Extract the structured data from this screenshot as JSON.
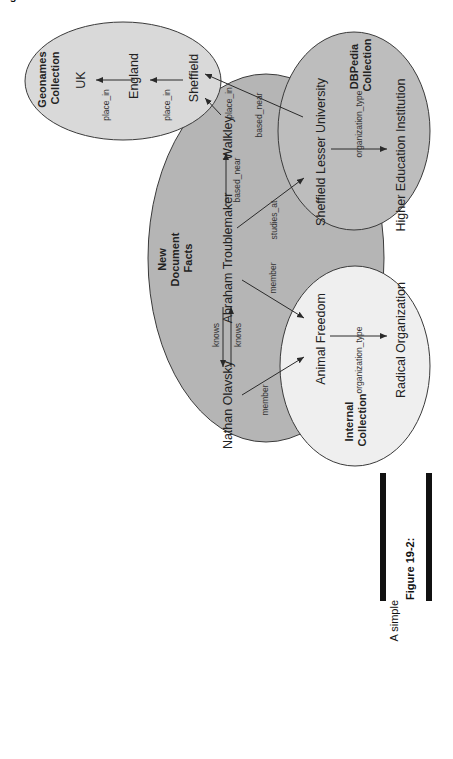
{
  "figure": {
    "orientation": "rotated-90-ccw",
    "caption": {
      "label": "Figure 19-2:",
      "lines": [
        "A simple",
        "graph",
        "showing",
        "assertions",
        "across four",
        "different",
        "ontologies."
      ]
    }
  },
  "colors": {
    "background": "#ffffff",
    "new_document_fill": "#b5b5b5",
    "dbpedia_fill": "#bdbdbd",
    "geonames_fill": "#d9d9d9",
    "internal_fill": "#efefef",
    "stroke": "#3a3a3a",
    "caption_bar": "#111111"
  },
  "collections": {
    "geonames": {
      "title_line1": "Geonames",
      "title_line2": "Collection"
    },
    "new_document": {
      "title_line1": "New",
      "title_line2": "Document",
      "title_line3": "Facts"
    },
    "dbpedia": {
      "title_line1": "DBPedia",
      "title_line2": "Collection"
    },
    "internal": {
      "title_line1": "Internal",
      "title_line2": "Collection"
    }
  },
  "nodes": {
    "uk": "UK",
    "england": "England",
    "sheffield": "Sheffield",
    "walkley": "Walkley",
    "abraham": "Abraham Troublemaker",
    "nathan": "Nathan Olavsky",
    "sheffield_lesser": "Sheffield Lesser University",
    "higher_ed": "Higher Education Institution",
    "animal_freedom": "Animal Freedom",
    "radical_org": "Radical Organization"
  },
  "edges": {
    "england_uk": "place_in",
    "sheffield_england": "place_in",
    "walkley_sheffield": "place_in",
    "abraham_walkley": "based_near",
    "slu_sheffield": "based_near",
    "abraham_slu": "studies_at",
    "abraham_af": "member",
    "nathan_af": "member",
    "nathan_abraham": "knows",
    "abraham_nathan": "knows",
    "slu_hei": "organization_type",
    "af_ro": "organization_type"
  }
}
